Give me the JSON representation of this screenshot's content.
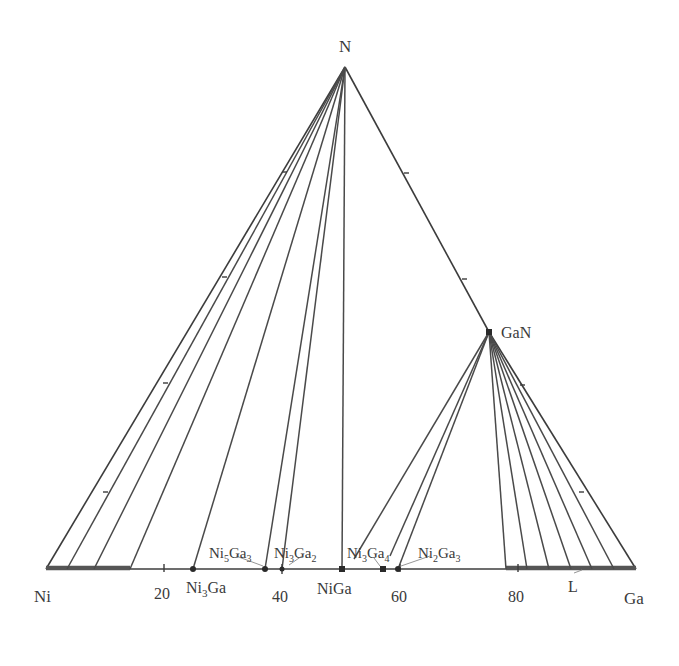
{
  "diagram": {
    "type": "ternary-phase-diagram-section",
    "title": "",
    "vertices": {
      "top": {
        "label": "N",
        "x": 345,
        "y": 67
      },
      "left": {
        "label": "Ni",
        "x": 46,
        "y": 569
      },
      "right": {
        "label": "Ga",
        "x": 636,
        "y": 569
      }
    },
    "compounds": {
      "gan": {
        "label": "GaN",
        "x": 489,
        "y": 332
      }
    },
    "baseline_axis": {
      "ticks": [
        {
          "label": "20",
          "x": 164
        },
        {
          "label": "40",
          "x": 282
        },
        {
          "label": "60",
          "x": 400
        },
        {
          "label": "80",
          "x": 518
        }
      ]
    },
    "binary_phases": [
      {
        "name": "ni3ga",
        "base": "Ni",
        "sub1": "3",
        "mid": "Ga",
        "sub2": "",
        "x": 193
      },
      {
        "name": "ni5ga3",
        "base": "Ni",
        "sub1": "5",
        "mid": "Ga",
        "sub2": "3",
        "x": 265
      },
      {
        "name": "ni3ga2",
        "base": "Ni",
        "sub1": "3",
        "mid": "Ga",
        "sub2": "2",
        "x": 282
      },
      {
        "name": "niga",
        "base": "NiGa",
        "sub1": "",
        "mid": "",
        "sub2": "",
        "x": 342
      },
      {
        "name": "ni3ga4",
        "base": "Ni",
        "sub1": "3",
        "mid": "Ga",
        "sub2": "4",
        "x": 381
      },
      {
        "name": "ni2ga3",
        "base": "Ni",
        "sub1": "2",
        "mid": "Ga",
        "sub2": "3",
        "x": 398
      }
    ],
    "regions": {
      "liquid": {
        "label": "L",
        "x_start": 506,
        "x_end": 636
      },
      "ni_solid_solution": {
        "x_start": 46,
        "x_end": 130
      }
    },
    "tie_lines_from_N_to_baseline_x": [
      67,
      94,
      130,
      193,
      265,
      282,
      342
    ],
    "tie_lines_from_GaN_to_baseline_x": [
      381,
      398,
      506,
      527,
      549,
      571,
      592,
      614
    ],
    "labels": {
      "n": "N",
      "ni": "Ni",
      "ga": "Ga",
      "gan": "GaN",
      "l": "L",
      "t20": "20",
      "t40": "40",
      "t60": "60",
      "t80": "80",
      "ni3ga_base": "Ni",
      "ni3ga_sub": "3",
      "ni3ga_tail": "Ga",
      "ni5ga3_base": "Ni",
      "ni5ga3_sub1": "5",
      "ni5ga3_mid": "Ga",
      "ni5ga3_sub2": "3",
      "ni3ga2_base": "Ni",
      "ni3ga2_sub1": "3",
      "ni3ga2_mid": "Ga",
      "ni3ga2_sub2": "2",
      "niga": "NiGa",
      "ni3ga4_base": "Ni",
      "ni3ga4_sub1": "3",
      "ni3ga4_mid": "Ga",
      "ni3ga4_sub2": "4",
      "ni2ga3_base": "Ni",
      "ni2ga3_sub1": "2",
      "ni2ga3_mid": "Ga",
      "ni2ga3_sub2": "3"
    },
    "colors": {
      "line": "#3c3c3c",
      "text": "#3a3a3a",
      "background": "#ffffff"
    }
  }
}
